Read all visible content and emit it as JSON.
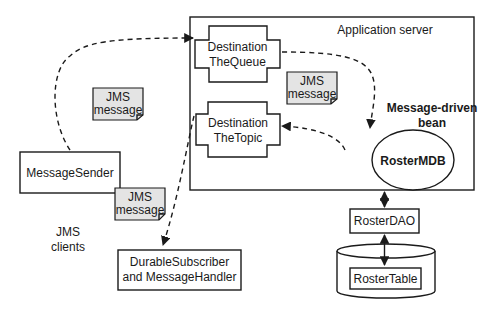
{
  "diagram": {
    "app_server": {
      "label": "Application server"
    },
    "queue": {
      "line1": "Destination",
      "line2": "TheQueue"
    },
    "topic": {
      "line1": "Destination",
      "line2": "TheTopic"
    },
    "mdb": {
      "label": "RosterMDB",
      "caption_line1": "Message-driven",
      "caption_line2": "bean"
    },
    "sender": {
      "label": "MessageSender"
    },
    "subscriber": {
      "line1": "DurableSubscriber",
      "line2": "and MessageHandler"
    },
    "dao": {
      "label": "RosterDAO"
    },
    "table": {
      "label": "RosterTable"
    },
    "clients": {
      "line1": "JMS",
      "line2": "clients"
    },
    "notes": [
      {
        "line1": "JMS",
        "line2": "message"
      },
      {
        "line1": "JMS",
        "line2": "message"
      },
      {
        "line1": "JMS",
        "line2": "message"
      }
    ],
    "colors": {
      "stroke": "#1a1a1a",
      "note_fill": "#e4e4e4",
      "background": "#ffffff"
    }
  }
}
